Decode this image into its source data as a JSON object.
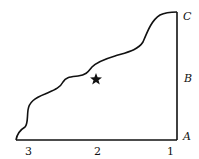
{
  "diagram": {
    "side_labels": {
      "top": "C",
      "middle": "B",
      "bottom": "A"
    },
    "base_labels": {
      "left": "3",
      "middle": "2",
      "right": "1"
    },
    "marker": "star",
    "colors": {
      "stroke": "#111111",
      "background": "#ffffff"
    }
  }
}
